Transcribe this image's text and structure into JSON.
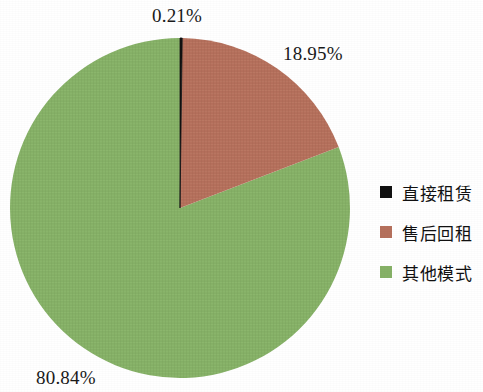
{
  "chart_data": {
    "type": "pie",
    "title": "",
    "categories": [
      "直接租赁",
      "售后回租",
      "其他模式"
    ],
    "values": [
      0.21,
      18.95,
      80.84
    ],
    "value_labels": [
      "0.21%",
      "18.95%",
      "80.84%"
    ],
    "colors": [
      "#111111",
      "#b5705c",
      "#86b167"
    ],
    "start_angle_deg": 0,
    "direction": "clockwise",
    "legend_position": "right",
    "grid": false,
    "xlabel": "",
    "ylabel": ""
  },
  "labels": {
    "black_slice": "0.21%",
    "red_slice": "18.95%",
    "green_slice": "80.84%"
  },
  "legend": {
    "items": [
      {
        "label": "直接租赁",
        "color": "#111111",
        "value_label": "0.21%"
      },
      {
        "label": "售后回租",
        "color": "#b5705c",
        "value_label": "18.95%"
      },
      {
        "label": "其他模式",
        "color": "#86b167",
        "value_label": "80.84%"
      }
    ]
  },
  "colors": {
    "background": "#ffffff",
    "text": "#1a1a1a",
    "slice_black": "#111111",
    "slice_red": "#b5705c",
    "slice_green": "#86b167"
  }
}
